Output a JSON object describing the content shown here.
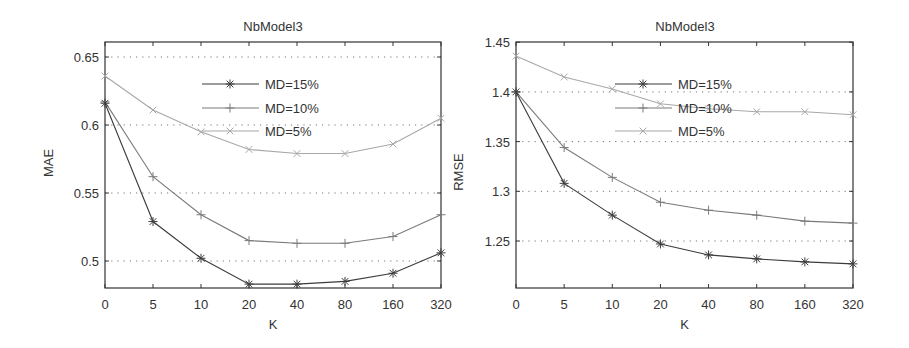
{
  "chart_data": [
    {
      "type": "line",
      "title": "NbModel3",
      "xlabel": "K",
      "ylabel": "MAE",
      "categories": [
        "0",
        "5",
        "10",
        "20",
        "40",
        "80",
        "160",
        "320"
      ],
      "ylim": [
        0.48,
        0.66
      ],
      "yticks": [
        "0.5",
        "0.55",
        "0.6",
        "0.65"
      ],
      "grid": "y-dotted",
      "legend_position": "upper-center",
      "series": [
        {
          "name": "MD=15%",
          "marker": "asterisk",
          "color": "#3c3c3c",
          "values": [
            0.616,
            0.529,
            0.502,
            0.483,
            0.483,
            0.485,
            0.491,
            0.506
          ]
        },
        {
          "name": "MD=10%",
          "marker": "plus",
          "color": "#7a7a7a",
          "values": [
            0.617,
            0.562,
            0.534,
            0.515,
            0.513,
            0.513,
            0.518,
            0.534
          ]
        },
        {
          "name": "MD=5%",
          "marker": "x",
          "color": "#a8a8a8",
          "values": [
            0.636,
            0.611,
            0.595,
            0.582,
            0.579,
            0.579,
            0.586,
            0.605
          ]
        }
      ]
    },
    {
      "type": "line",
      "title": "NbModel3",
      "xlabel": "K",
      "ylabel": "RMSE",
      "categories": [
        "0",
        "5",
        "10",
        "20",
        "40",
        "80",
        "160",
        "320"
      ],
      "ylim": [
        1.2,
        1.45
      ],
      "yticks": [
        "1.25",
        "1.3",
        "1.35",
        "1.4",
        "1.45"
      ],
      "grid": "y-dotted",
      "legend_position": "upper-center",
      "series": [
        {
          "name": "MD=15%",
          "marker": "asterisk",
          "color": "#3c3c3c",
          "values": [
            1.4,
            1.308,
            1.276,
            1.247,
            1.236,
            1.232,
            1.229,
            1.227
          ]
        },
        {
          "name": "MD=10%",
          "marker": "plus",
          "color": "#7a7a7a",
          "values": [
            1.4,
            1.344,
            1.314,
            1.289,
            1.281,
            1.276,
            1.27,
            1.268
          ]
        },
        {
          "name": "MD=5%",
          "marker": "x",
          "color": "#a8a8a8",
          "values": [
            1.436,
            1.415,
            1.403,
            1.388,
            1.383,
            1.38,
            1.38,
            1.377
          ]
        }
      ]
    }
  ]
}
